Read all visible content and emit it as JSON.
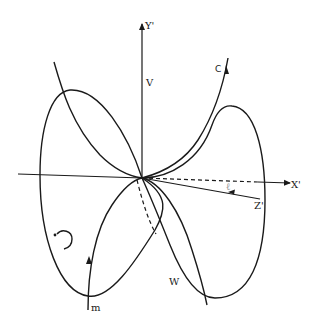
{
  "diagram": {
    "type": "geometric figure-eight curves with 3D axes",
    "axes": {
      "y_label": "Y'",
      "x_label": "X'",
      "z_label": "Z'"
    },
    "labels": {
      "v": "V",
      "c": "C",
      "w": "W",
      "m": "m",
      "ell": "ℓ"
    },
    "colors": {
      "stroke": "#1a1a1a",
      "background": "#ffffff",
      "faint_label": "#9a9a9a"
    }
  }
}
